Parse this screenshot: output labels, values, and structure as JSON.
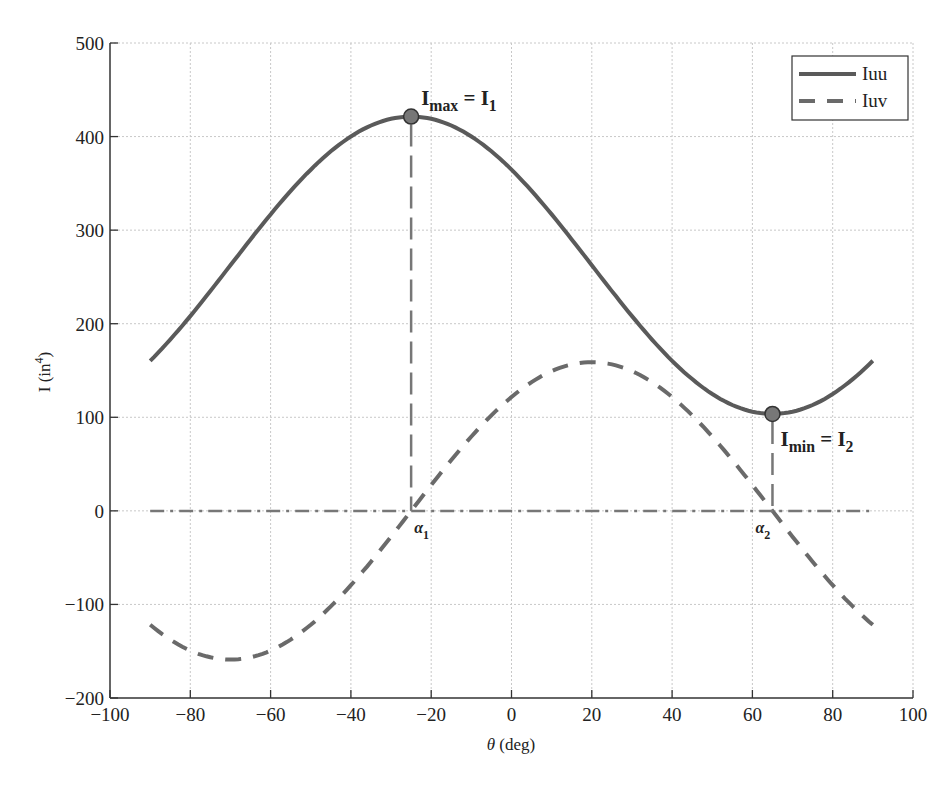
{
  "chart_data": {
    "type": "line",
    "title": "",
    "xlabel": "θ (deg)",
    "ylabel": "I (in⁴)",
    "xlim": [
      -100,
      100
    ],
    "ylim": [
      -200,
      500
    ],
    "xticks": [
      -100,
      -80,
      -60,
      -40,
      -20,
      0,
      20,
      40,
      60,
      80,
      100
    ],
    "yticks": [
      -200,
      -100,
      0,
      100,
      200,
      300,
      400,
      500
    ],
    "xtick_labels": [
      "−100",
      "−80",
      "−60",
      "−40",
      "−20",
      "0",
      "20",
      "40",
      "60",
      "80",
      "100"
    ],
    "ytick_labels": [
      "−200",
      "−100",
      "0",
      "100",
      "200",
      "300",
      "400",
      "500"
    ],
    "grid": true,
    "legend_position": "upper right",
    "x": [
      -90,
      -80,
      -70,
      -60,
      -50,
      -40,
      -30,
      -25,
      -20,
      -10,
      0,
      10,
      20,
      30,
      40,
      50,
      60,
      65,
      70,
      80,
      90
    ],
    "series": [
      {
        "name": "Iuu",
        "style": "solid",
        "color": "#5a5a5a",
        "values": [
          160.4,
          206.8,
          262.5,
          318.2,
          364.6,
          394.9,
          419.0,
          421.4,
          419.0,
          404.6,
          364.6,
          318.2,
          262.5,
          206.8,
          160.4,
          130.1,
          106.0,
          103.6,
          106.0,
          130.1,
          160.4
        ]
      },
      {
        "name": "Iuv",
        "style": "dashed",
        "color": "#6a6a6a",
        "values": [
          -121.7,
          -149.3,
          -158.9,
          -149.3,
          -121.7,
          -79.5,
          -27.6,
          0,
          27.6,
          79.5,
          121.7,
          149.3,
          158.9,
          149.3,
          121.7,
          79.5,
          27.6,
          0,
          -27.6,
          -79.5,
          -121.7
        ]
      },
      {
        "name": "zero-line",
        "style": "dash-dot",
        "color": "#777777",
        "values": [
          0,
          0,
          0,
          0,
          0,
          0,
          0,
          0,
          0,
          0,
          0,
          0,
          0,
          0,
          0,
          0,
          0,
          0,
          0,
          0,
          0
        ]
      }
    ],
    "markers": [
      {
        "label": "Imax = I1",
        "x": -25,
        "y": 421.4
      },
      {
        "label": "Imin = I2",
        "x": 65,
        "y": 103.6
      }
    ],
    "annotations": [
      {
        "text": "Imax = I1",
        "main": "I",
        "sub": "max",
        "eq": " = I",
        "sub2": "1",
        "x": -25,
        "y": 421.4
      },
      {
        "text": "Imin = I2",
        "main": "I",
        "sub": "min",
        "eq": " = I",
        "sub2": "2",
        "x": 65,
        "y": 103.6
      },
      {
        "text": "α1",
        "main": "α",
        "sub": "1",
        "x": -25,
        "y": 0
      },
      {
        "text": "α2",
        "main": "α",
        "sub": "2",
        "x": 65,
        "y": 0
      }
    ],
    "legend": [
      "Iuu",
      "Iuv"
    ]
  },
  "labels": {
    "xlabel_theta": "θ",
    "xlabel_rest": " (deg)",
    "ylabel_main": "I (in",
    "ylabel_sup": "4",
    "ylabel_close": ")"
  }
}
